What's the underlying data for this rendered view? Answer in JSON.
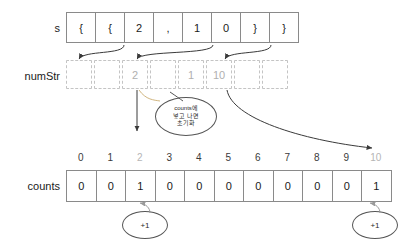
{
  "diagram": {
    "rows": {
      "s": {
        "label": "s",
        "cells": [
          "{",
          "{",
          "2",
          ",",
          "1",
          "0",
          "}",
          "}"
        ]
      },
      "numStr": {
        "label": "numStr",
        "cells": [
          "",
          "",
          "2",
          "",
          "1",
          "10",
          "",
          ""
        ]
      },
      "counts": {
        "label": "counts",
        "indices": [
          "0",
          "1",
          "2",
          "3",
          "4",
          "5",
          "6",
          "7",
          "8",
          "9",
          "10"
        ],
        "muted_indices": [
          "2",
          "10"
        ],
        "values": [
          "0",
          "0",
          "1",
          "0",
          "0",
          "0",
          "0",
          "0",
          "0",
          "0",
          "1"
        ]
      }
    },
    "annotations": {
      "note_bubble": {
        "line1": "counts에",
        "line2": "넣고 나면",
        "line3": "초기화"
      },
      "increment_left": "+1",
      "increment_right": "+1"
    },
    "colors": {
      "solid_border": "#8a8a8a",
      "dashed_border": "#c4c4c4",
      "muted_text": "#b0b0b0",
      "text": "#1a1a1a",
      "arrow": "#3a3a3a"
    }
  }
}
